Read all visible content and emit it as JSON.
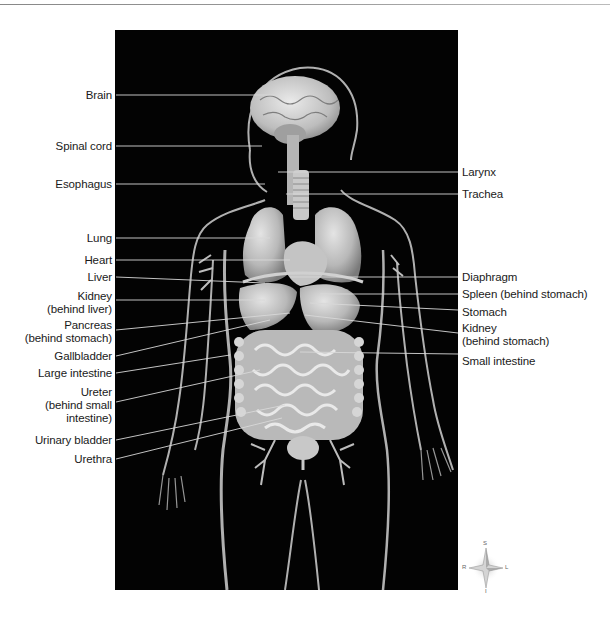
{
  "diagram": {
    "title": "",
    "background_panel_color": "#030303",
    "label_color": "#1a1a1a",
    "leader_line_color": "#d8d8d8"
  },
  "labels_left": [
    {
      "id": "brain",
      "text": "Brain"
    },
    {
      "id": "spinal-cord",
      "text": "Spinal cord"
    },
    {
      "id": "esophagus",
      "text": "Esophagus"
    },
    {
      "id": "lung",
      "text": "Lung"
    },
    {
      "id": "heart",
      "text": "Heart"
    },
    {
      "id": "liver",
      "text": "Liver"
    },
    {
      "id": "kidney-left",
      "line1": "Kidney",
      "line2": "(behind liver)"
    },
    {
      "id": "pancreas",
      "line1": "Pancreas",
      "line2": "(behind stomach)"
    },
    {
      "id": "gallbladder",
      "text": "Gallbladder"
    },
    {
      "id": "large-intestine",
      "text": "Large intestine"
    },
    {
      "id": "ureter",
      "line1": "Ureter",
      "line2": "(behind small",
      "line3": "intestine)"
    },
    {
      "id": "urinary-bladder",
      "text": "Urinary bladder"
    },
    {
      "id": "urethra",
      "text": "Urethra"
    }
  ],
  "labels_right": [
    {
      "id": "larynx",
      "text": "Larynx"
    },
    {
      "id": "trachea",
      "text": "Trachea"
    },
    {
      "id": "diaphragm",
      "text": "Diaphragm"
    },
    {
      "id": "spleen",
      "text": "Spleen (behind stomach)"
    },
    {
      "id": "stomach",
      "text": "Stomach"
    },
    {
      "id": "kidney-right",
      "line1": "Kidney",
      "line2": "(behind stomach)"
    },
    {
      "id": "small-intestine",
      "text": "Small intestine"
    }
  ],
  "compass": {
    "top": "S",
    "bottom": "I",
    "left": "R",
    "right": "L"
  }
}
